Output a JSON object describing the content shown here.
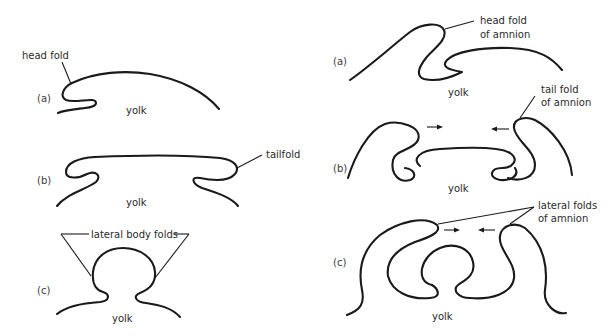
{
  "figure": {
    "left_column": {
      "title": "Body folds of the embryo",
      "panels": [
        {
          "id": "a",
          "panel_label": "(a)",
          "yolk_label": "yolk",
          "annotations": [
            "head fold"
          ]
        },
        {
          "id": "b",
          "panel_label": "(b)",
          "yolk_label": "yolk",
          "annotations": [
            "tailfold"
          ]
        },
        {
          "id": "c",
          "panel_label": "(c)",
          "yolk_label": "yolk",
          "annotations": [
            "lateral body folds"
          ]
        }
      ]
    },
    "right_column": {
      "title": "Amnion folds",
      "panels": [
        {
          "id": "a",
          "panel_label": "(a)",
          "yolk_label": "yolk",
          "annotations": [
            "head fold",
            "of amnion"
          ]
        },
        {
          "id": "b",
          "panel_label": "(b)",
          "yolk_label": "yolk",
          "annotations": [
            "tail fold",
            "of amnion"
          ],
          "arrows": [
            "right",
            "left"
          ]
        },
        {
          "id": "c",
          "panel_label": "(c)",
          "yolk_label": "yolk",
          "annotations": [
            "lateral folds",
            "of amnion"
          ],
          "arrows": [
            "right",
            "left"
          ]
        }
      ]
    },
    "colors": {
      "line": "#1a1a1a",
      "text": "#2a2a2a",
      "background": "#ffffff"
    }
  }
}
